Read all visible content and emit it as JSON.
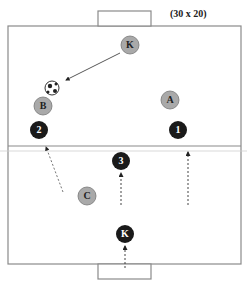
{
  "diagram": {
    "title": "(30 x 20)",
    "field": {
      "x": 8,
      "y": 26,
      "w": 233,
      "h": 238,
      "stroke": "#8a8a8a"
    },
    "midline_y": 146,
    "goals": [
      {
        "name": "top-goal",
        "x": 98,
        "y": 11,
        "w": 53,
        "h": 15
      },
      {
        "name": "bottom-goal",
        "x": 98,
        "y": 264,
        "w": 53,
        "h": 15
      }
    ],
    "colors": {
      "grey_player": "#a9a9a9",
      "black_player": "#1a1a1a",
      "line": "#8a8a8a"
    },
    "players": [
      {
        "id": "K-grey",
        "label": "K",
        "team": "grey",
        "x": 130,
        "y": 45
      },
      {
        "id": "B",
        "label": "B",
        "team": "grey",
        "x": 43,
        "y": 106
      },
      {
        "id": "A",
        "label": "A",
        "team": "grey",
        "x": 170,
        "y": 100
      },
      {
        "id": "C",
        "label": "C",
        "team": "grey",
        "x": 87,
        "y": 196
      },
      {
        "id": "2",
        "label": "2",
        "team": "black",
        "x": 39,
        "y": 130
      },
      {
        "id": "1",
        "label": "1",
        "team": "black",
        "x": 178,
        "y": 130
      },
      {
        "id": "3",
        "label": "3",
        "team": "black",
        "x": 121,
        "y": 161
      },
      {
        "id": "K-black",
        "label": "K",
        "team": "black",
        "x": 125,
        "y": 234
      }
    ],
    "ball": {
      "x": 52,
      "y": 88
    },
    "arrows": [
      {
        "name": "pass-K-to-ball",
        "style": "solid",
        "from": [
          120,
          53
        ],
        "to": [
          66,
          80
        ]
      },
      {
        "name": "run-C-to-2",
        "style": "dotted",
        "from": [
          63,
          192
        ],
        "to": [
          46,
          147
        ]
      },
      {
        "name": "run-to-3",
        "style": "dotted",
        "from": [
          121,
          205
        ],
        "to": [
          121,
          173
        ]
      },
      {
        "name": "run-to-1",
        "style": "dotted",
        "from": [
          188,
          205
        ],
        "to": [
          188,
          152
        ]
      },
      {
        "name": "run-to-K-black",
        "style": "dotted",
        "from": [
          125,
          268
        ],
        "to": [
          125,
          246
        ]
      }
    ]
  }
}
